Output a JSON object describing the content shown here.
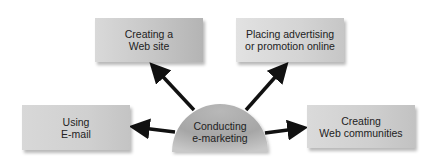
{
  "diagram": {
    "type": "hub-and-spoke",
    "center": {
      "label": "Conducting\ne-marketing",
      "shape": "semicircle"
    },
    "nodes": [
      {
        "id": "web-site",
        "label": "Creating a\nWeb site",
        "position": "top-left"
      },
      {
        "id": "advertising",
        "label": "Placing advertising\nor promotion online",
        "position": "top-right"
      },
      {
        "id": "email",
        "label": "Using\nE-mail",
        "position": "left"
      },
      {
        "id": "communities",
        "label": "Creating\nWeb communities",
        "position": "right"
      }
    ],
    "edges": [
      {
        "from": "center",
        "to": "web-site",
        "style": "arrow"
      },
      {
        "from": "center",
        "to": "advertising",
        "style": "arrow"
      },
      {
        "from": "center",
        "to": "email",
        "style": "arrow"
      },
      {
        "from": "center",
        "to": "communities",
        "style": "arrow"
      }
    ],
    "colors": {
      "arrow": "#111111",
      "box_fill": "#cccccc",
      "hub_fill": "#a8a8a8",
      "text": "#222222",
      "background": "#ffffff"
    }
  }
}
